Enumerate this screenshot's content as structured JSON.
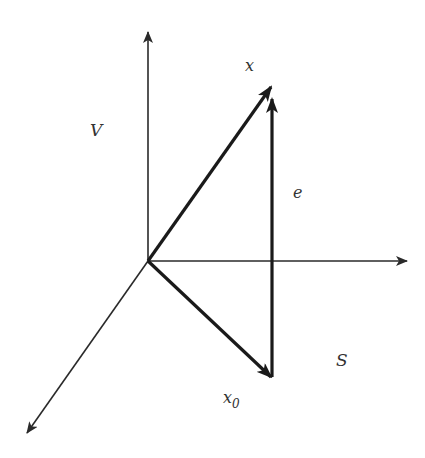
{
  "diagram": {
    "colors": {
      "axis": "#2a2a2a",
      "vector": "#1a1a1a",
      "label": "#333333",
      "background": "#ffffff"
    },
    "origin": [
      148,
      261
    ],
    "axes": [
      {
        "name": "vertical-axis",
        "from": [
          148,
          261
        ],
        "to": [
          148,
          30
        ]
      },
      {
        "name": "horizontal-axis",
        "from": [
          148,
          261
        ],
        "to": [
          407,
          261
        ]
      },
      {
        "name": "diagonal-axis",
        "from": [
          148,
          261
        ],
        "to": [
          26,
          434
        ]
      }
    ],
    "vectors": [
      {
        "name": "x",
        "from": [
          148,
          261
        ],
        "to": [
          272,
          86
        ]
      },
      {
        "name": "x0",
        "from": [
          148,
          261
        ],
        "to": [
          272,
          378
        ]
      },
      {
        "name": "e",
        "from": [
          272,
          378
        ],
        "to": [
          272,
          98
        ]
      }
    ],
    "labels": {
      "V": "V",
      "x": "x",
      "e": "e",
      "S": "S",
      "x0_base": "x",
      "x0_sub": "0"
    }
  }
}
